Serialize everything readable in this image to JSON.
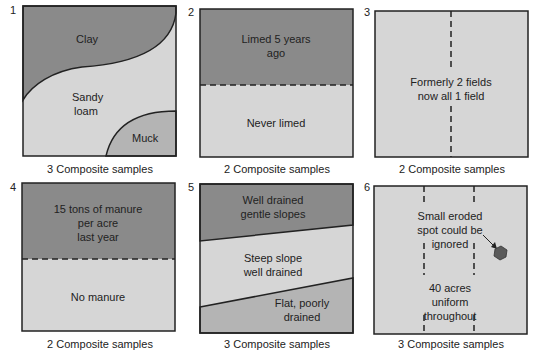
{
  "colors": {
    "dark": "#8a8a8a",
    "medium": "#b4b4b4",
    "light": "#d6d6d6",
    "border": "#222222",
    "spot": "#5a5a5a"
  },
  "panels": [
    {
      "number": "1",
      "regions": [
        "Clay",
        "Sandy",
        "loam",
        "Muck"
      ],
      "caption": "3 Composite samples"
    },
    {
      "number": "2",
      "regions": [
        "Limed 5 years",
        "ago",
        "Never limed"
      ],
      "caption": "2 Composite samples"
    },
    {
      "number": "3",
      "regions": [
        "Formerly 2 fields",
        "now all 1 field"
      ],
      "caption": "2 Composite samples"
    },
    {
      "number": "4",
      "regions": [
        "15 tons of manure",
        "per acre",
        "last year",
        "No manure"
      ],
      "caption": "2 Composite samples"
    },
    {
      "number": "5",
      "regions": [
        "Well drained",
        "gentle slopes",
        "Steep slope",
        "well drained",
        "Flat, poorly",
        "drained"
      ],
      "caption": "3 Composite samples"
    },
    {
      "number": "6",
      "regions": [
        "Small eroded",
        "spot could be",
        "ignored",
        "40 acres",
        "uniform",
        "throughout"
      ],
      "caption": "3 Composite samples"
    }
  ]
}
